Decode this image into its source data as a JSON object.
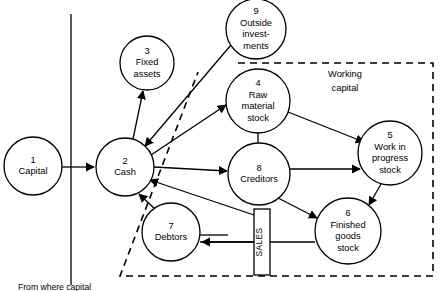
{
  "diagram": {
    "stroke_color": "#000000",
    "background_color": "#ffffff",
    "nodes": [
      {
        "id": "1",
        "number": "1",
        "lines": [
          "Capital"
        ],
        "cx": 33,
        "cy": 166,
        "r": 29
      },
      {
        "id": "2",
        "number": "2",
        "lines": [
          "Cash"
        ],
        "cx": 125,
        "cy": 167,
        "r": 29
      },
      {
        "id": "3",
        "number": "3",
        "lines": [
          "Fixed",
          "assets"
        ],
        "cx": 147,
        "cy": 63,
        "r": 27
      },
      {
        "id": "4",
        "number": "4",
        "lines": [
          "Raw",
          "material",
          "stock"
        ],
        "cx": 258,
        "cy": 101,
        "r": 32
      },
      {
        "id": "5",
        "number": "5",
        "lines": [
          "Work in",
          "progress",
          "stock"
        ],
        "cx": 390,
        "cy": 153,
        "r": 32
      },
      {
        "id": "6",
        "number": "6",
        "lines": [
          "Finished",
          "goods",
          "stock"
        ],
        "cx": 348,
        "cy": 231,
        "r": 33
      },
      {
        "id": "7",
        "number": "7",
        "lines": [
          "Debtors"
        ],
        "cx": 171,
        "cy": 232,
        "r": 29
      },
      {
        "id": "8",
        "number": "8",
        "lines": [
          "Creditors"
        ],
        "cx": 259,
        "cy": 174,
        "r": 31
      },
      {
        "id": "9",
        "number": "9",
        "lines": [
          "Outside",
          "invest-",
          "ments"
        ],
        "cx": 256,
        "cy": 29,
        "r": 30
      }
    ],
    "region_label": {
      "lines": [
        "Working",
        "capital"
      ],
      "x": 345,
      "y": 77
    },
    "sales_box": {
      "label": "SALES",
      "x": 254,
      "y": 209,
      "width": 16,
      "height": 66
    },
    "caption": "From where capital"
  }
}
